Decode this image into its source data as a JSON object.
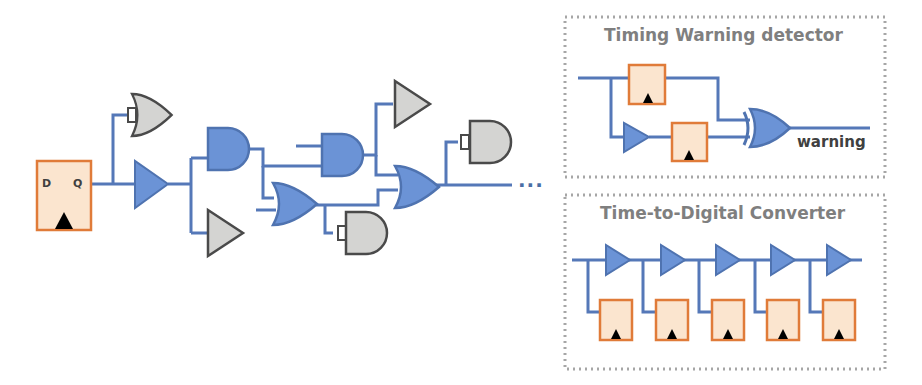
{
  "diagram": {
    "main_circuit": {
      "flip_flop": {
        "d_label": "D",
        "q_label": "Q"
      },
      "continuation": "..."
    },
    "panels": [
      {
        "title": "Timing Warning detector",
        "output_label": "warning"
      },
      {
        "title": "Time-to-Digital Converter",
        "stages": 5
      }
    ],
    "colors": {
      "wire": "#5578b8",
      "active_gate_fill": "#6b93d6",
      "active_gate_stroke": "#4f73b0",
      "inactive_gate_fill": "#d4d4d2",
      "inactive_gate_stroke": "#4a4a4a",
      "flipflop_fill": "#fbe5cf",
      "flipflop_stroke": "#e07b39",
      "panel_border": "#a6a6a6"
    }
  }
}
